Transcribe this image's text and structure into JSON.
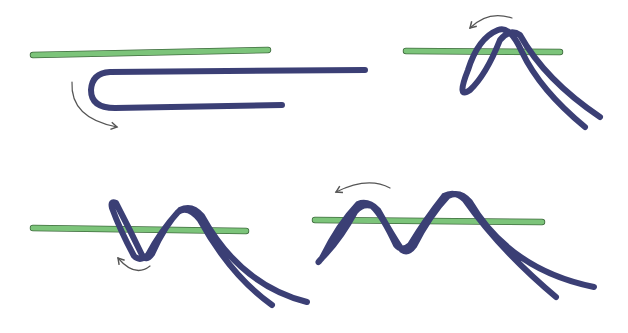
{
  "diagram": {
    "type": "knot-tying-illustration",
    "panels": [
      {
        "step": 1,
        "description": "Line doubled back alongside rod, arrow indicates wrap direction"
      },
      {
        "step": 2,
        "description": "First wrap of doubled line over rod, arrow indicates next direction"
      },
      {
        "step": 3,
        "description": "Second wrap added, arrow curving under"
      },
      {
        "step": 4,
        "description": "Third wrap added, arrow indicating continued wrapping"
      }
    ],
    "colors": {
      "rod": "#7cc47a",
      "line": "#3b3f75",
      "arrow": "#555555",
      "background": "#ffffff"
    }
  }
}
